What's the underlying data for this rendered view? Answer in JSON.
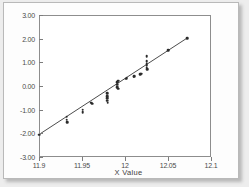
{
  "chart_data": {
    "type": "scatter",
    "title": "",
    "subtitle": "",
    "xlabel": "X Value",
    "ylabel": "",
    "xlim": [
      11.9,
      12.1
    ],
    "ylim": [
      -3.0,
      3.0
    ],
    "grid": false,
    "legend": null,
    "xticks": [
      "11.9",
      "11.95",
      "12",
      "12.05",
      "12.1"
    ],
    "xtick_values": [
      11.9,
      11.95,
      12.0,
      12.05,
      12.1
    ],
    "yticks": [
      "3.00",
      "2.00",
      "1.00",
      "0.00",
      "-1.00",
      "-2.00",
      "-3.00"
    ],
    "ytick_values": [
      3.0,
      2.0,
      1.0,
      0.0,
      -1.0,
      -2.0,
      -3.0
    ],
    "series": [
      {
        "name": "Normal probability plot points",
        "marker": "filled-circle",
        "color": "#2a2a2a",
        "points": [
          [
            11.9,
            -2.05
          ],
          [
            11.932,
            -1.3
          ],
          [
            11.932,
            -1.42
          ],
          [
            11.933,
            -1.52
          ],
          [
            11.951,
            -1.0
          ],
          [
            11.951,
            -1.1
          ],
          [
            11.961,
            -0.7
          ],
          [
            11.962,
            -0.75
          ],
          [
            11.979,
            -0.3
          ],
          [
            11.979,
            -0.42
          ],
          [
            11.979,
            -0.52
          ],
          [
            11.979,
            -0.62
          ],
          [
            11.98,
            -0.7
          ],
          [
            11.991,
            0.15
          ],
          [
            11.991,
            0.05
          ],
          [
            11.991,
            -0.05
          ],
          [
            11.992,
            0.22
          ],
          [
            11.992,
            -0.12
          ],
          [
            12.001,
            0.3
          ],
          [
            12.002,
            0.32
          ],
          [
            12.01,
            0.4
          ],
          [
            12.011,
            0.42
          ],
          [
            12.018,
            0.5
          ],
          [
            12.019,
            0.52
          ],
          [
            12.025,
            1.25
          ],
          [
            12.025,
            1.05
          ],
          [
            12.025,
            0.92
          ],
          [
            12.025,
            0.85
          ],
          [
            12.025,
            0.78
          ],
          [
            12.026,
            0.7
          ],
          [
            12.05,
            1.52
          ],
          [
            12.072,
            2.02
          ]
        ]
      }
    ],
    "fit_line": {
      "name": "reference-line",
      "color": "#4c4c4c",
      "x_start": 11.9,
      "y_start": -2.05,
      "x_end": 12.072,
      "y_end": 2.02
    }
  }
}
